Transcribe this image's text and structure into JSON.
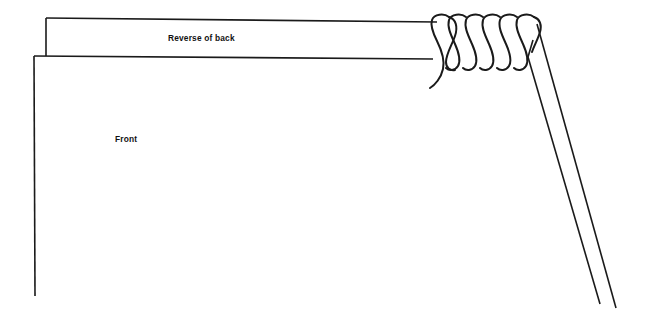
{
  "diagram": {
    "type": "line-drawing",
    "background_color": "#ffffff",
    "stroke_color": "#1a1a1a",
    "canvas": {
      "width": 658,
      "height": 325
    },
    "labels": {
      "reverse_of_back": "Reverse of back",
      "front": "Front"
    },
    "panels": [
      {
        "name": "reverse-of-back-flap",
        "label": "Reverse of back",
        "description": "Narrow horizontal flap along the top of the drawing"
      },
      {
        "name": "front-panel",
        "label": "Front",
        "description": "Large open rectangle occupying the body of the drawing"
      }
    ],
    "binding": {
      "name": "spiral-coil",
      "coil_count": 6,
      "coil_spacing_px": 17,
      "start_x": 432,
      "end_x": 540,
      "top_y": 16,
      "bottom_y": 68
    },
    "geometry": {
      "flap_top_y": 18,
      "flap_bottom_y": 56,
      "flap_left_x": 46,
      "outer_left_x": 34,
      "panel_bottom_y": 296,
      "horizontal_top_end_x": 437,
      "horizontal_bottom_end_x": 433,
      "diagonal_outer_end": [
        616,
        308
      ],
      "diagonal_inner_end": [
        600,
        304
      ]
    }
  }
}
